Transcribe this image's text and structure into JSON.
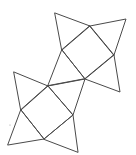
{
  "figure": {
    "stroke_color": "#4a4a4a",
    "background": "#ffffff",
    "vertices": {
      "A": [
        55,
        13
      ],
      "B": [
        90,
        26
      ],
      "C": [
        126,
        19
      ],
      "D": [
        62,
        50
      ],
      "E": [
        114,
        55
      ],
      "F": [
        85,
        79
      ],
      "G": [
        120,
        92
      ],
      "H": [
        14,
        72
      ],
      "I": [
        48,
        86
      ],
      "J": [
        21,
        110
      ],
      "K": [
        73,
        115
      ],
      "L": [
        44,
        139
      ],
      "M": [
        8,
        145
      ],
      "N": [
        78,
        152
      ]
    },
    "squares": [
      [
        "B",
        "E",
        "F",
        "D"
      ],
      [
        "I",
        "K",
        "L",
        "J"
      ]
    ],
    "triangles": [
      [
        "A",
        "B",
        "D"
      ],
      [
        "B",
        "C",
        "E"
      ],
      [
        "E",
        "G",
        "F"
      ],
      [
        "D",
        "F",
        "I"
      ],
      [
        "F",
        "K",
        "I"
      ],
      [
        "H",
        "I",
        "J"
      ],
      [
        "J",
        "L",
        "M"
      ],
      [
        "L",
        "K",
        "N"
      ]
    ],
    "stray_dot": [
      10,
      125
    ]
  }
}
